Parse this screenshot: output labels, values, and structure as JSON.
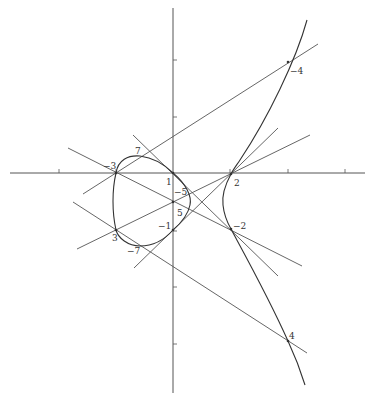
{
  "colors": {
    "line": "#555555",
    "axis": "#555555",
    "curve": "#333333",
    "label": "#333333"
  },
  "axes": {
    "x_axis": {
      "x1": 10,
      "y1": 173,
      "x2": 365,
      "y2": 173
    },
    "y_axis": {
      "x1": 173,
      "y1": 8,
      "x2": 173,
      "y2": 393
    },
    "x_ticks": [
      59,
      116,
      230,
      288,
      345
    ],
    "y_ticks": [
      60,
      117,
      231,
      287,
      344
    ]
  },
  "curves": [
    {
      "name": "left-oval",
      "d": "M116,173 C118,160 128,155 140,156 C156,158 166,166 173,173 C186,184 192,196 190,205 C188,215 180,224 173,230 C166,238 155,246 140,246 C128,246 118,238 116,230 C112,212 112,190 116,173 Z"
    },
    {
      "name": "right-branch",
      "d": "M307,20 C296,60 268,118 240,160 C236,166 233,170 231,174 C225,185 222,197 223,205 C224,215 227,222 231,229 C240,246 268,296 288,341 C295,356 301,372 305,385"
    }
  ],
  "lines": [
    {
      "name": "line-through-minus3-minus4",
      "x1": 83,
      "y1": 194,
      "x2": 318,
      "y2": 44
    },
    {
      "name": "line-through-3-2",
      "x1": 77,
      "y1": 249,
      "x2": 310,
      "y2": 135
    },
    {
      "name": "line-through-minus1-2",
      "x1": 134,
      "y1": 268,
      "x2": 278,
      "y2": 128
    },
    {
      "name": "line-through-minus3-minus2",
      "x1": 68,
      "y1": 148,
      "x2": 302,
      "y2": 266
    },
    {
      "name": "line-through-1-minus2",
      "x1": 133,
      "y1": 135,
      "x2": 278,
      "y2": 276
    },
    {
      "name": "line-through-4",
      "x1": 73,
      "y1": 202,
      "x2": 307,
      "y2": 353
    }
  ],
  "labels": [
    {
      "text": "−3",
      "x": 103,
      "y": 169
    },
    {
      "text": "7",
      "x": 135,
      "y": 154
    },
    {
      "text": "1",
      "x": 166,
      "y": 185
    },
    {
      "text": "−5",
      "x": 174,
      "y": 195
    },
    {
      "text": "5",
      "x": 177,
      "y": 216
    },
    {
      "text": "−1",
      "x": 158,
      "y": 229
    },
    {
      "text": "3",
      "x": 112,
      "y": 241
    },
    {
      "text": "−7",
      "x": 127,
      "y": 254
    },
    {
      "text": "2",
      "x": 234,
      "y": 186
    },
    {
      "text": "−2",
      "x": 233,
      "y": 229
    },
    {
      "text": "−4",
      "x": 290,
      "y": 74
    },
    {
      "text": "4",
      "x": 289,
      "y": 339
    }
  ],
  "points": [
    {
      "name": "point-minus3",
      "x": 116,
      "y": 173
    },
    {
      "name": "point-1",
      "x": 173,
      "y": 173
    },
    {
      "name": "point-2",
      "x": 231,
      "y": 174
    },
    {
      "name": "point-3",
      "x": 116,
      "y": 230
    },
    {
      "name": "point-minus1",
      "x": 173,
      "y": 230
    },
    {
      "name": "point-minus2",
      "x": 231,
      "y": 229
    },
    {
      "name": "point-minus4",
      "x": 288,
      "y": 62
    },
    {
      "name": "point-4",
      "x": 288,
      "y": 341
    },
    {
      "name": "point-axis-mid",
      "x": 173,
      "y": 202
    }
  ]
}
